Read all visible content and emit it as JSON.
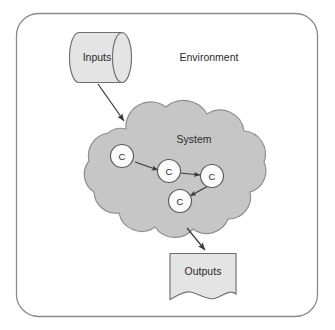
{
  "diagram": {
    "environment": {
      "label": "Environment",
      "border_color": "#7a7a7a",
      "fill_color": "#ffffff"
    },
    "inputs": {
      "label": "Inputs",
      "shape": "cylinder",
      "fill_color": "#e4e4e4",
      "border_color": "#6e6e6e"
    },
    "system": {
      "label": "System",
      "shape": "cloud",
      "fill_color": "#c6c6c6",
      "border_color": "#8c8c8c",
      "nodes": [
        {
          "label": "C",
          "name": "node-c1"
        },
        {
          "label": "C",
          "name": "node-c2"
        },
        {
          "label": "C",
          "name": "node-c3"
        },
        {
          "label": "C",
          "name": "node-c4"
        }
      ],
      "node_fill_color": "#fbfbfb",
      "node_border_color": "#5a5a5a",
      "connections": [
        {
          "from": "C",
          "to": "C",
          "name": "edge-c1-c2"
        },
        {
          "from": "C",
          "to": "C",
          "name": "edge-c2-c3"
        },
        {
          "from": "C",
          "to": "C",
          "name": "edge-c3-c4"
        }
      ]
    },
    "outputs": {
      "label": "Outputs",
      "shape": "document",
      "fill_color": "#e4e4e4",
      "border_color": "#6e6e6e"
    },
    "flows": [
      {
        "name": "flow-inputs-to-system",
        "from": "Inputs",
        "to": "System"
      },
      {
        "name": "flow-system-to-outputs",
        "from": "System",
        "to": "Outputs"
      }
    ],
    "arrow_color": "#3a3a3a"
  }
}
